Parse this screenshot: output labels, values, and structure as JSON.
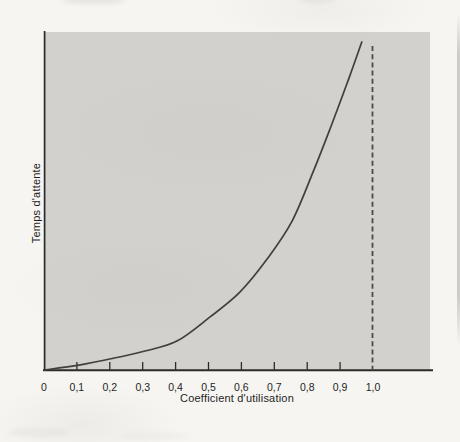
{
  "figure": {
    "background_color": "#f6f5f2",
    "plot_background_color": "#d2d1ce",
    "axis_color": "#2b2b28",
    "curve_color": "#3f3f3c",
    "dashed_line_color": "#4b4b48",
    "text_color": "#1e1e1c"
  },
  "chart_data": {
    "type": "line",
    "title": "",
    "xlabel": "Coefficient d'utilisation",
    "ylabel": "Temps d'attente",
    "xlim": [
      0,
      1.17
    ],
    "ylim": [
      0,
      1.03
    ],
    "grid": false,
    "legend": "none",
    "x_ticks": {
      "values": [
        0,
        0.1,
        0.2,
        0.3,
        0.4,
        0.5,
        0.6,
        0.7,
        0.8,
        0.9,
        1.0
      ],
      "labels": [
        "0",
        "0,1",
        "0,2",
        "0,3",
        "0,4",
        "0,5",
        "0,6",
        "0,7",
        "0,8",
        "0,9",
        "1,0"
      ]
    },
    "y_ticks": {
      "values": [],
      "labels": []
    },
    "series": [
      {
        "name": "temps-attente",
        "style": "solid",
        "x": [
          0,
          0.106,
          0.207,
          0.307,
          0.404,
          0.505,
          0.596,
          0.678,
          0.754,
          0.818,
          0.875,
          0.927,
          0.966
        ],
        "y": [
          0,
          0.015,
          0.035,
          0.058,
          0.088,
          0.162,
          0.238,
          0.338,
          0.454,
          0.604,
          0.75,
          0.89,
          1.0
        ]
      }
    ],
    "asymptote": {
      "x": 1.0,
      "style": "dashed"
    }
  }
}
